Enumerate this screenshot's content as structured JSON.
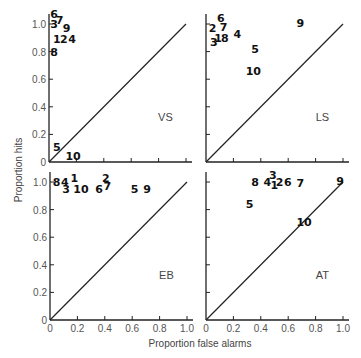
{
  "chart_data": {
    "type": "scatter",
    "xlabel": "Proportion false alarms",
    "ylabel": "Proportion hits",
    "xlim": [
      0,
      1.0
    ],
    "ylim": [
      0,
      1.0
    ],
    "x_ticks": [
      "0",
      "0.2",
      "0.4",
      "0.6",
      "0.8",
      "1.0"
    ],
    "y_ticks": [
      "0",
      "0.2",
      "0.4",
      "0.6",
      "0.8",
      "1.0"
    ],
    "grid": false,
    "reference_line": "diagonal y = x",
    "panels": [
      {
        "label": "VS",
        "position": "top-left",
        "show_x_tick_labels": false,
        "show_y_tick_labels": true,
        "points": [
          {
            "id": "6",
            "x": 0.01,
            "y": 1.07
          },
          {
            "id": "3",
            "x": 0.01,
            "y": 1.0
          },
          {
            "id": "7",
            "x": 0.05,
            "y": 1.03
          },
          {
            "id": "9",
            "x": 0.1,
            "y": 0.97
          },
          {
            "id": "1",
            "x": 0.03,
            "y": 0.89
          },
          {
            "id": "2",
            "x": 0.08,
            "y": 0.89
          },
          {
            "id": "4",
            "x": 0.14,
            "y": 0.89
          },
          {
            "id": "8",
            "x": 0.01,
            "y": 0.8
          },
          {
            "id": "5",
            "x": 0.03,
            "y": 0.11
          },
          {
            "id": "10",
            "x": 0.12,
            "y": 0.04
          }
        ]
      },
      {
        "label": "LS",
        "position": "top-right",
        "show_x_tick_labels": false,
        "show_y_tick_labels": false,
        "points": [
          {
            "id": "6",
            "x": 0.08,
            "y": 1.04
          },
          {
            "id": "2",
            "x": 0.02,
            "y": 0.97
          },
          {
            "id": "7",
            "x": 0.1,
            "y": 0.98
          },
          {
            "id": "1",
            "x": 0.06,
            "y": 0.9
          },
          {
            "id": "8",
            "x": 0.11,
            "y": 0.9
          },
          {
            "id": "3",
            "x": 0.03,
            "y": 0.87
          },
          {
            "id": "4",
            "x": 0.2,
            "y": 0.93
          },
          {
            "id": "5",
            "x": 0.33,
            "y": 0.82
          },
          {
            "id": "10",
            "x": 0.29,
            "y": 0.66
          },
          {
            "id": "9",
            "x": 0.66,
            "y": 1.01
          }
        ]
      },
      {
        "label": "EB",
        "position": "bottom-left",
        "show_x_tick_labels": true,
        "show_y_tick_labels": true,
        "points": [
          {
            "id": "8",
            "x": 0.02,
            "y": 1.0
          },
          {
            "id": "4",
            "x": 0.08,
            "y": 1.0
          },
          {
            "id": "1",
            "x": 0.15,
            "y": 1.03
          },
          {
            "id": "3",
            "x": 0.09,
            "y": 0.95
          },
          {
            "id": "10",
            "x": 0.17,
            "y": 0.95
          },
          {
            "id": "2",
            "x": 0.38,
            "y": 1.03
          },
          {
            "id": "6",
            "x": 0.33,
            "y": 0.95
          },
          {
            "id": "7",
            "x": 0.39,
            "y": 0.97
          },
          {
            "id": "5",
            "x": 0.59,
            "y": 0.95
          },
          {
            "id": "9",
            "x": 0.68,
            "y": 0.95
          }
        ]
      },
      {
        "label": "AT",
        "position": "bottom-right",
        "show_x_tick_labels": true,
        "show_y_tick_labels": false,
        "points": [
          {
            "id": "8",
            "x": 0.33,
            "y": 1.0
          },
          {
            "id": "4",
            "x": 0.42,
            "y": 1.0
          },
          {
            "id": "3",
            "x": 0.46,
            "y": 1.05
          },
          {
            "id": "1",
            "x": 0.47,
            "y": 0.98
          },
          {
            "id": "2",
            "x": 0.51,
            "y": 1.0
          },
          {
            "id": "6",
            "x": 0.57,
            "y": 1.0
          },
          {
            "id": "7",
            "x": 0.66,
            "y": 0.99
          },
          {
            "id": "9",
            "x": 0.95,
            "y": 1.01
          },
          {
            "id": "5",
            "x": 0.29,
            "y": 0.84
          },
          {
            "id": "10",
            "x": 0.66,
            "y": 0.71
          }
        ]
      }
    ]
  }
}
